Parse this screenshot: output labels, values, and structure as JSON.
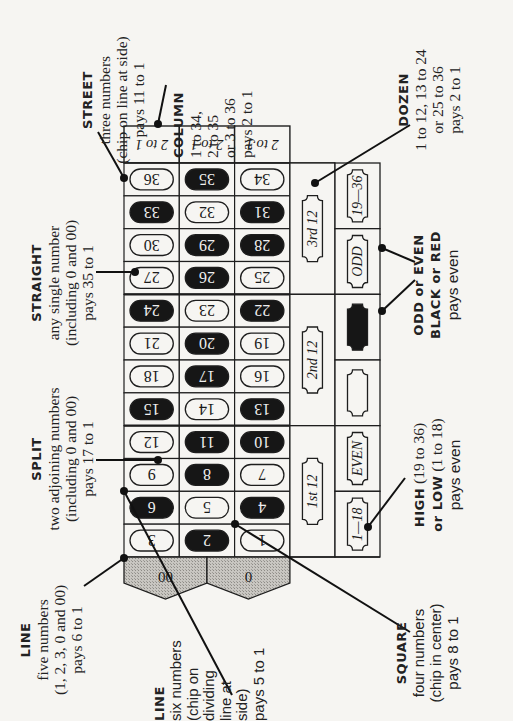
{
  "layout": {
    "numbers_grid": {
      "x": 124,
      "y_header_top": 126,
      "y_rows_top": 163,
      "y_rows_bottom": 557,
      "col_width": 55.3,
      "rows": 12
    },
    "dozen_col": {
      "x": 290,
      "width": 45
    },
    "evenmoney_col": {
      "x": 335,
      "width": 45
    }
  },
  "colors": {
    "line": "#1e1e1e",
    "paper": "#f6f5f2",
    "black_pocket": "#161616",
    "zero_fill": "#b9b7b2"
  },
  "board": {
    "column_headers": [
      "2 to 1",
      "2 to 1",
      "2 to 1"
    ],
    "rows": [
      [
        {
          "n": "36",
          "black": false
        },
        {
          "n": "35",
          "black": true
        },
        {
          "n": "34",
          "black": false
        }
      ],
      [
        {
          "n": "33",
          "black": true
        },
        {
          "n": "32",
          "black": false
        },
        {
          "n": "31",
          "black": true
        }
      ],
      [
        {
          "n": "30",
          "black": false
        },
        {
          "n": "29",
          "black": true
        },
        {
          "n": "28",
          "black": true
        }
      ],
      [
        {
          "n": "27",
          "black": false
        },
        {
          "n": "26",
          "black": true
        },
        {
          "n": "25",
          "black": false
        }
      ],
      [
        {
          "n": "24",
          "black": true
        },
        {
          "n": "23",
          "black": false
        },
        {
          "n": "22",
          "black": true
        }
      ],
      [
        {
          "n": "21",
          "black": false
        },
        {
          "n": "20",
          "black": true
        },
        {
          "n": "19",
          "black": false
        }
      ],
      [
        {
          "n": "18",
          "black": false
        },
        {
          "n": "17",
          "black": true
        },
        {
          "n": "16",
          "black": false
        }
      ],
      [
        {
          "n": "15",
          "black": true
        },
        {
          "n": "14",
          "black": false
        },
        {
          "n": "13",
          "black": true
        }
      ],
      [
        {
          "n": "12",
          "black": false
        },
        {
          "n": "11",
          "black": true
        },
        {
          "n": "10",
          "black": true
        }
      ],
      [
        {
          "n": "9",
          "black": false
        },
        {
          "n": "8",
          "black": true
        },
        {
          "n": "7",
          "black": false
        }
      ],
      [
        {
          "n": "6",
          "black": true
        },
        {
          "n": "5",
          "black": false
        },
        {
          "n": "4",
          "black": true
        }
      ],
      [
        {
          "n": "3",
          "black": false
        },
        {
          "n": "2",
          "black": true
        },
        {
          "n": "1",
          "black": false
        }
      ]
    ],
    "zeros": [
      "00",
      "0"
    ],
    "dozens": [
      "3rd 12",
      "2nd 12",
      "1st 12"
    ],
    "even_money": [
      "19—36",
      "ODD",
      "BLACK",
      "RED",
      "EVEN",
      "1—18"
    ]
  },
  "labels": {
    "street": {
      "title": "STREET",
      "lines": [
        "three numbers",
        "(chip on line at side)",
        "pays 11 to 1"
      ]
    },
    "column": {
      "title": "COLUMN",
      "lines": [
        "1 to 34,",
        "2 to 35",
        "or 3 to 36",
        "pays 2 to 1"
      ]
    },
    "dozen": {
      "title": "DOZEN",
      "lines": [
        "1 to 12, 13 to 24",
        "or 25 to 36",
        "pays 2 to 1"
      ]
    },
    "straight": {
      "title": "STRAIGHT",
      "lines": [
        "any single number",
        "(including 0 and 00)",
        "pays 35 to 1"
      ]
    },
    "odd_even": {
      "title_1": "ODD or EVEN",
      "title_2": "BLACK or RED",
      "lines": [
        "pays even"
      ]
    },
    "split": {
      "title": "SPLIT",
      "lines": [
        "two adjoining numbers",
        "(including 0 and 00)",
        "pays 17 to 1"
      ]
    },
    "high_low": {
      "title_1": "HIGH",
      "title_1_rest": " (19 to 36)",
      "title_2": "or LOW",
      "title_2_rest": " (1 to 18)",
      "lines": [
        "pays even"
      ]
    },
    "line5": {
      "title": "LINE",
      "lines": [
        "five numbers",
        "(1, 2, 3, 0 and 00)",
        "pays 6 to 1"
      ]
    },
    "line6": {
      "title": "LINE",
      "lines": [
        "six numbers",
        "(chip on",
        "dividing",
        "line at",
        "side)",
        "pays 5 to 1"
      ]
    },
    "square": {
      "title": "SQUARE",
      "lines": [
        "four numbers",
        "(chip in center)",
        "pays 8 to 1"
      ]
    }
  }
}
